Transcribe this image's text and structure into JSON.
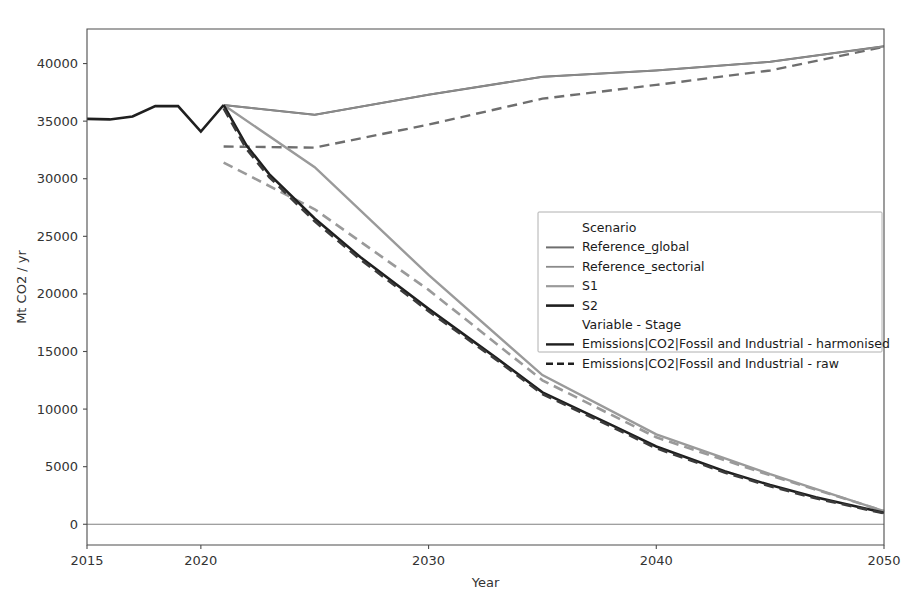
{
  "chart_data": {
    "type": "line",
    "title": "",
    "xlabel": "Year",
    "ylabel": "Mt CO2 / yr",
    "xlim": [
      2015,
      2050
    ],
    "ylim": [
      -1800,
      43000
    ],
    "xticks": [
      2015,
      2020,
      2030,
      2040,
      2050
    ],
    "xticklabels": [
      "2015",
      "2020",
      "2030",
      "2040",
      "2050"
    ],
    "yticks": [
      0,
      5000,
      10000,
      15000,
      20000,
      25000,
      30000,
      35000,
      40000
    ],
    "yticklabels": [
      "0",
      "5000",
      "10000",
      "15000",
      "20000",
      "25000",
      "30000",
      "35000",
      "40000"
    ],
    "grid": false,
    "legend_position": "center-right",
    "zero_line": 0,
    "history": {
      "x": [
        2015,
        2016,
        2017,
        2018,
        2019,
        2020,
        2021
      ],
      "y": [
        35200,
        35150,
        35400,
        36300,
        36300,
        34100,
        36400
      ]
    },
    "series": [
      {
        "name": "Reference_global - harmonised",
        "scenario": "Reference_global",
        "stage": "harmonised",
        "color": "#6e6e6e",
        "dash": "none",
        "width": 2.0,
        "x": [
          2021,
          2025,
          2030,
          2035,
          2040,
          2045,
          2050
        ],
        "y": [
          36400,
          35550,
          37300,
          38850,
          39400,
          40150,
          41500
        ]
      },
      {
        "name": "Reference_global - raw",
        "scenario": "Reference_global",
        "stage": "raw",
        "color": "#6e6e6e",
        "dash": "10,6",
        "width": 2.4,
        "x": [
          2021,
          2025,
          2030,
          2035,
          2040,
          2045,
          2050
        ],
        "y": [
          32800,
          32700,
          34700,
          36950,
          38150,
          39400,
          41450
        ]
      },
      {
        "name": "Reference_sectorial - harmonised",
        "scenario": "Reference_sectorial",
        "stage": "harmonised",
        "color": "#8a8a8a",
        "dash": "none",
        "width": 1.8,
        "x": [
          2021,
          2025,
          2030,
          2035,
          2040,
          2045,
          2050
        ],
        "y": [
          36400,
          35550,
          37300,
          38850,
          39400,
          40150,
          41500
        ]
      },
      {
        "name": "S1 - harmonised",
        "scenario": "S1",
        "stage": "harmonised",
        "color": "#9a9a9a",
        "dash": "none",
        "width": 2.4,
        "x": [
          2021,
          2025,
          2030,
          2035,
          2040,
          2045,
          2050
        ],
        "y": [
          36400,
          31000,
          21650,
          12950,
          7800,
          4350,
          1150
        ]
      },
      {
        "name": "S1 - raw",
        "scenario": "S1",
        "stage": "raw",
        "color": "#9a9a9a",
        "dash": "10,6",
        "width": 2.6,
        "x": [
          2021,
          2025,
          2030,
          2035,
          2040,
          2045,
          2050
        ],
        "y": [
          31400,
          27350,
          20350,
          12500,
          7550,
          4250,
          1150
        ]
      },
      {
        "name": "S2 - harmonised",
        "scenario": "S2",
        "stage": "harmonised",
        "color": "#1f1f1f",
        "dash": "none",
        "width": 2.6,
        "x": [
          2021,
          2022,
          2023,
          2025,
          2027,
          2030,
          2033,
          2035,
          2038,
          2040,
          2043,
          2045,
          2047,
          2050
        ],
        "y": [
          36400,
          32900,
          30400,
          26550,
          23200,
          18700,
          14400,
          11450,
          8650,
          6750,
          4600,
          3400,
          2350,
          1000
        ]
      },
      {
        "name": "S2 - raw",
        "scenario": "S2",
        "stage": "raw",
        "color": "#3a3a3a",
        "dash": "10,6",
        "width": 2.6,
        "x": [
          2021,
          2022,
          2023,
          2025,
          2027,
          2030,
          2033,
          2035,
          2038,
          2040,
          2043,
          2045,
          2047,
          2050
        ],
        "y": [
          36100,
          32600,
          30150,
          26300,
          23000,
          18500,
          14250,
          11300,
          8500,
          6600,
          4500,
          3300,
          2250,
          950
        ]
      }
    ]
  },
  "legend": {
    "groups": [
      {
        "heading": "Scenario",
        "entries": [
          {
            "label": "Reference_global",
            "color": "#6e6e6e",
            "dash": "none",
            "width": 2.0
          },
          {
            "label": "Reference_sectorial",
            "color": "#8a8a8a",
            "dash": "none",
            "width": 1.8
          },
          {
            "label": "S1",
            "color": "#9a9a9a",
            "dash": "none",
            "width": 2.2
          },
          {
            "label": "S2",
            "color": "#1f1f1f",
            "dash": "none",
            "width": 2.6
          }
        ]
      },
      {
        "heading": "Variable - Stage",
        "entries": [
          {
            "label": "Emissions|CO2|Fossil and Industrial - harmonised",
            "color": "#1f1f1f",
            "dash": "none",
            "width": 2.4
          },
          {
            "label": "Emissions|CO2|Fossil and Industrial - raw",
            "color": "#1f1f1f",
            "dash": "7,4",
            "width": 2.4
          }
        ]
      }
    ]
  }
}
